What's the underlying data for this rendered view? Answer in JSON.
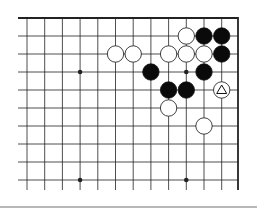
{
  "board": {
    "cols": 12,
    "rows": 10,
    "origin_x": 27,
    "origin_y": 18,
    "spacing_x": 17.7,
    "spacing_y": 18,
    "right_edge_x": 238,
    "bottom_y": 190,
    "top_edge": true,
    "right_edge": true,
    "colors": {
      "line": "#222222",
      "black": "#0a0a0a",
      "white": "#ffffff"
    }
  },
  "star_points": [
    {
      "col": 3,
      "row": 3
    },
    {
      "col": 9,
      "row": 3
    },
    {
      "col": 3,
      "row": 9
    },
    {
      "col": 9,
      "row": 9
    }
  ],
  "stones": [
    {
      "col": 9,
      "row": 1,
      "color": "white"
    },
    {
      "col": 10,
      "row": 1,
      "color": "black"
    },
    {
      "col": 11,
      "row": 1,
      "color": "black"
    },
    {
      "col": 5,
      "row": 2,
      "color": "white"
    },
    {
      "col": 6,
      "row": 2,
      "color": "white"
    },
    {
      "col": 8,
      "row": 2,
      "color": "white"
    },
    {
      "col": 9,
      "row": 2,
      "color": "white"
    },
    {
      "col": 10,
      "row": 2,
      "color": "white"
    },
    {
      "col": 11,
      "row": 2,
      "color": "black"
    },
    {
      "col": 7,
      "row": 3,
      "color": "black"
    },
    {
      "col": 10,
      "row": 3,
      "color": "black"
    },
    {
      "col": 8,
      "row": 4,
      "color": "black"
    },
    {
      "col": 9,
      "row": 4,
      "color": "black"
    },
    {
      "col": 11,
      "row": 4,
      "color": "white",
      "marker": "triangle"
    },
    {
      "col": 8,
      "row": 5,
      "color": "white"
    },
    {
      "col": 10,
      "row": 6,
      "color": "white"
    }
  ]
}
